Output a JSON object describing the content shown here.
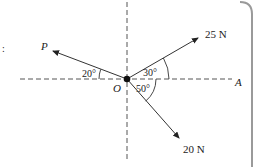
{
  "diagram": {
    "type": "force-diagram",
    "origin_label": "O",
    "axis_label": "A",
    "forces": [
      {
        "label": "P",
        "angle_from_horizontal_deg": 20,
        "direction": "upper-left"
      },
      {
        "label": "25 N",
        "angle_from_horizontal_deg": 30,
        "direction": "upper-right"
      },
      {
        "label": "20 N",
        "angle_from_horizontal_deg": 50,
        "direction": "lower-right"
      }
    ],
    "angle_labels": [
      "20°",
      "30°",
      "50°"
    ],
    "colors": {
      "line": "#333333",
      "dashed": "#555555",
      "frame": "#999999"
    }
  }
}
